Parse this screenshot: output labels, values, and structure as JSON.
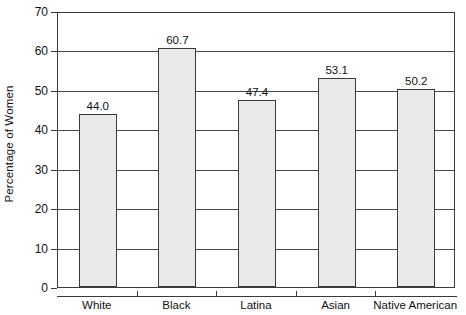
{
  "chart_data": {
    "type": "bar",
    "title": "",
    "subtitle": "",
    "xlabel": "",
    "ylabel": "Percentage of Women",
    "categories": [
      "White",
      "Black",
      "Latina",
      "Asian",
      "Native American"
    ],
    "values": [
      44.0,
      60.7,
      47.4,
      53.1,
      50.2
    ],
    "data_labels": [
      "44.0",
      "60.7",
      "47.4",
      "53.1",
      "50.2"
    ],
    "ylim": [
      0,
      70
    ],
    "ytick_values": [
      0,
      10,
      20,
      30,
      40,
      50,
      60,
      70
    ],
    "ytick_labels": [
      "0",
      "10",
      "20",
      "30",
      "40",
      "50",
      "60",
      "70"
    ],
    "grid": "horizontal",
    "legend": "none",
    "bar_fill_color": "#e9e9e9",
    "bar_edge_color": "#3a3a3a",
    "axis_color": "#3a3a3a",
    "background_color": "#ffffff"
  }
}
